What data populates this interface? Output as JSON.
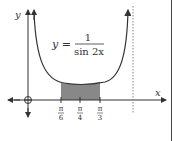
{
  "diagram": {
    "axis_x_label": "x",
    "axis_y_label": "y",
    "equation": {
      "lhs": "y =",
      "numerator": "1",
      "denominator": "sin 2x"
    },
    "ticks": [
      {
        "num": "π",
        "den": "6"
      },
      {
        "num": "π",
        "den": "4"
      },
      {
        "num": "π",
        "den": "3"
      }
    ],
    "origin_marker": "O",
    "shaded_region": "area under curve from π/6 to π/3",
    "asymptote": "x = π/2 (dotted)"
  }
}
